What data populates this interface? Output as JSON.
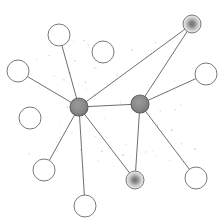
{
  "figure": {
    "kind": "network-graph-diagram",
    "title": "",
    "width": 223,
    "height": 223,
    "background_color": "#ffffff",
    "has_text_labels": false,
    "has_axes": false,
    "has_legend": false,
    "has_border": false
  },
  "chart_data": {
    "type": "scatter",
    "title": "",
    "subtitle": "",
    "xlabel": "",
    "ylabel": "",
    "xlim": [
      0,
      223
    ],
    "ylim": [
      0,
      223
    ],
    "grid": false,
    "legend_position": "none",
    "node_styles": {
      "hub": {
        "fill": "#8a8a8a",
        "stroke": "#5e5e5e",
        "radius": 9,
        "count": 2
      },
      "gradient": {
        "center_color": "#7d7d7d",
        "edge_color": "#f2f2f2",
        "stroke": "#7a7a7a",
        "radius": 9,
        "count": 2
      },
      "plain": {
        "fill": "#ffffff",
        "stroke": "#7a7a7a",
        "radius": 11,
        "count": 8
      }
    },
    "edge_style": {
      "stroke": "#6f6f6f",
      "width": 1
    },
    "nodes": [
      {
        "id": "hub-left",
        "style": "hub",
        "x": 79,
        "y": 107,
        "r": 9,
        "degree": 9
      },
      {
        "id": "hub-right",
        "style": "hub",
        "x": 140,
        "y": 104,
        "r": 9,
        "degree": 6
      },
      {
        "id": "grad-topright",
        "style": "gradient",
        "x": 192,
        "y": 24,
        "r": 9,
        "degree": 2
      },
      {
        "id": "grad-bottom",
        "style": "gradient",
        "x": 135,
        "y": 180,
        "r": 9,
        "degree": 2
      },
      {
        "id": "leaf-top",
        "style": "plain",
        "x": 59,
        "y": 35,
        "r": 11,
        "degree": 1
      },
      {
        "id": "leaf-upleft",
        "style": "plain",
        "x": 18,
        "y": 71,
        "r": 11,
        "degree": 1
      },
      {
        "id": "leaf-right",
        "style": "plain",
        "x": 206,
        "y": 74,
        "r": 11,
        "degree": 1
      },
      {
        "id": "leaf-lowleft",
        "style": "plain",
        "x": 44,
        "y": 170,
        "r": 11,
        "degree": 1
      },
      {
        "id": "leaf-bottom",
        "style": "plain",
        "x": 85,
        "y": 206,
        "r": 11,
        "degree": 1
      },
      {
        "id": "leaf-botright",
        "style": "plain",
        "x": 196,
        "y": 178,
        "r": 11,
        "degree": 1
      },
      {
        "id": "leaf-midleft",
        "style": "plain",
        "x": 30,
        "y": 118,
        "r": 11,
        "degree": 1
      },
      {
        "id": "leaf-upmid",
        "style": "plain",
        "x": 103,
        "y": 52,
        "r": 11,
        "degree": 1
      }
    ],
    "edges": [
      {
        "source": "hub-left",
        "target": "hub-right"
      },
      {
        "source": "hub-left",
        "target": "grad-topright"
      },
      {
        "source": "hub-right",
        "target": "grad-topright"
      },
      {
        "source": "hub-left",
        "target": "leaf-top"
      },
      {
        "source": "hub-left",
        "target": "leaf-upleft"
      },
      {
        "source": "hub-left",
        "target": "leaf-lowleft"
      },
      {
        "source": "hub-left",
        "target": "leaf-bottom"
      },
      {
        "source": "hub-left",
        "target": "grad-bottom"
      },
      {
        "source": "hub-right",
        "target": "leaf-right"
      },
      {
        "source": "hub-right",
        "target": "grad-bottom"
      },
      {
        "source": "hub-right",
        "target": "leaf-botright"
      }
    ],
    "speckles": {
      "color": "#c9c9c9",
      "count": 58,
      "note": "faint low-contrast dots scattered across the graph interior"
    }
  }
}
